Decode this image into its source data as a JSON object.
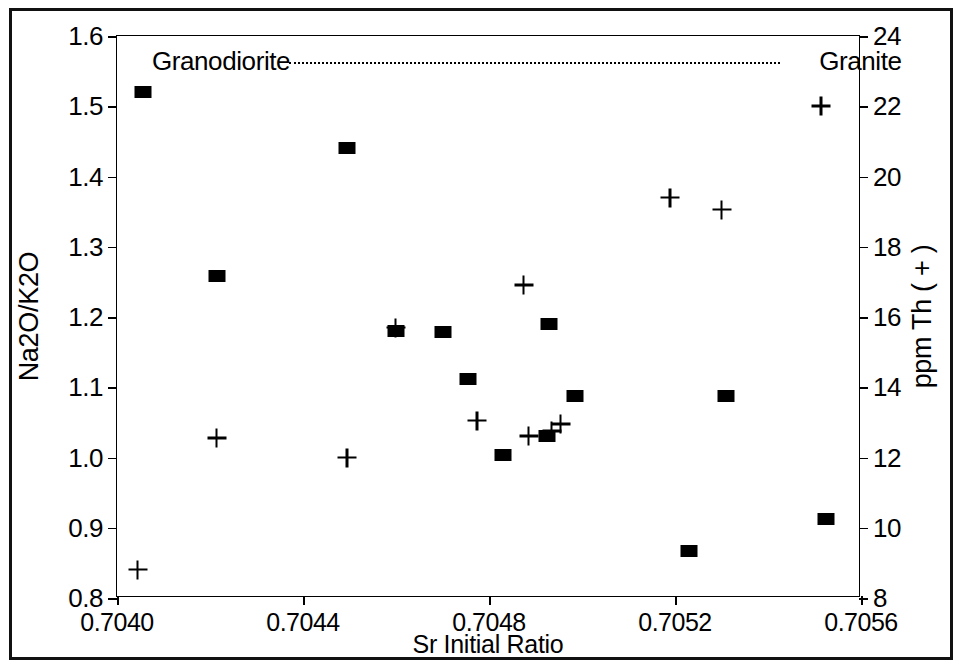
{
  "chart_data": {
    "type": "scatter",
    "title": "",
    "xlabel": "Sr Initial Ratio",
    "ylabel": "Na2O/K2O",
    "y2label": "ppm Th ( + )",
    "xlim": [
      0.704,
      0.7056
    ],
    "ylim": [
      0.8,
      1.6
    ],
    "y2lim": [
      8,
      24
    ],
    "grid": false,
    "legend": "none",
    "xticks": [
      "0.7040",
      "0.7044",
      "0.7048",
      "0.7052",
      "0.7056"
    ],
    "xtick_values": [
      0.704,
      0.7044,
      0.7048,
      0.7052,
      0.7056
    ],
    "yticks": [
      "0.8",
      "0.9",
      "1.0",
      "1.1",
      "1.2",
      "1.3",
      "1.4",
      "1.5",
      "1.6"
    ],
    "ytick_values": [
      0.8,
      0.9,
      1.0,
      1.1,
      1.2,
      1.3,
      1.4,
      1.5,
      1.6
    ],
    "y2ticks": [
      "8",
      "10",
      "12",
      "14",
      "16",
      "18",
      "20",
      "22",
      "24"
    ],
    "y2tick_values": [
      8,
      10,
      12,
      14,
      16,
      18,
      20,
      22,
      24
    ],
    "series": [
      {
        "name": "Na2O/K2O",
        "marker": "filled-square",
        "axis": "left",
        "points": [
          {
            "x": 0.704055,
            "y": 1.52
          },
          {
            "x": 0.704215,
            "y": 1.258
          },
          {
            "x": 0.704495,
            "y": 1.44
          },
          {
            "x": 0.7046,
            "y": 1.18
          },
          {
            "x": 0.7047,
            "y": 1.178
          },
          {
            "x": 0.704755,
            "y": 1.112
          },
          {
            "x": 0.70483,
            "y": 1.003
          },
          {
            "x": 0.70493,
            "y": 1.19
          },
          {
            "x": 0.704925,
            "y": 1.03
          },
          {
            "x": 0.704985,
            "y": 1.088
          },
          {
            "x": 0.70523,
            "y": 0.867
          },
          {
            "x": 0.70531,
            "y": 1.088
          },
          {
            "x": 0.705525,
            "y": 0.912
          }
        ]
      },
      {
        "name": "ppm Th",
        "marker": "plus",
        "axis": "right",
        "points": [
          {
            "x": 0.704045,
            "y": 8.8
          },
          {
            "x": 0.704215,
            "y": 12.55
          },
          {
            "x": 0.704495,
            "y": 12.0
          },
          {
            "x": 0.7046,
            "y": 15.7
          },
          {
            "x": 0.704775,
            "y": 13.05
          },
          {
            "x": 0.704875,
            "y": 16.9
          },
          {
            "x": 0.704885,
            "y": 12.6
          },
          {
            "x": 0.704935,
            "y": 12.75
          },
          {
            "x": 0.704955,
            "y": 12.95
          },
          {
            "x": 0.70519,
            "y": 19.4
          },
          {
            "x": 0.7053,
            "y": 19.05
          },
          {
            "x": 0.705515,
            "y": 22.0
          }
        ]
      }
    ],
    "annotations": [
      {
        "label": "Granodiorite",
        "x": 0.704075,
        "y": 1.565,
        "align": "left"
      },
      {
        "label": "Granite",
        "x": 0.70551,
        "y": 1.565,
        "align": "left"
      }
    ],
    "annotation_line": {
      "x_start": 0.70437,
      "x_end": 0.705425,
      "y": 1.562,
      "style": "dotted"
    }
  }
}
